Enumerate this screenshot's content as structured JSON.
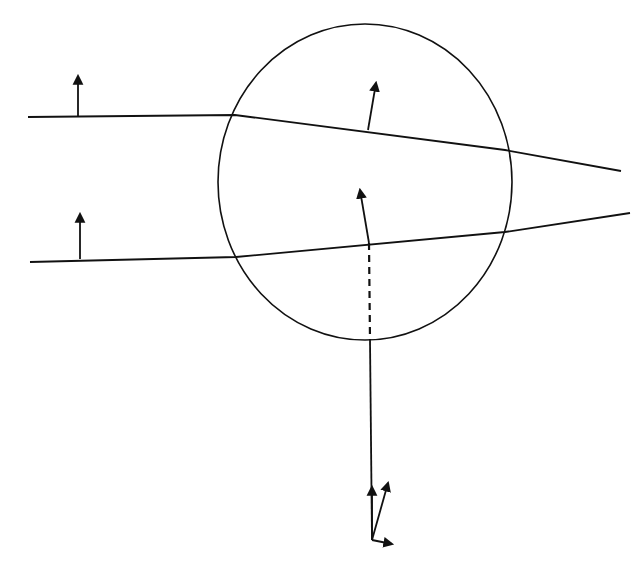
{
  "diagram": {
    "width": 641,
    "height": 567,
    "stroke_color": "#111111",
    "background": "#ffffff",
    "circle": {
      "cx": 365,
      "cy": 182,
      "rx": 147,
      "ry": 158
    },
    "beam_lines": [
      {
        "name": "upper-ray",
        "points": "28,117 235,115 505,150 621,171"
      },
      {
        "name": "lower-ray",
        "points": "30,262 236,257 505,232 630,213"
      }
    ],
    "arrows": [
      {
        "name": "upper-incident-arrow",
        "x1": 78,
        "y1": 117,
        "x2": 78,
        "y2": 76
      },
      {
        "name": "lower-incident-arrow",
        "x1": 80,
        "y1": 259,
        "x2": 80,
        "y2": 214
      },
      {
        "name": "upper-refracted-arrow",
        "x1": 368,
        "y1": 130,
        "x2": 376,
        "y2": 83
      },
      {
        "name": "center-arrow",
        "x1": 369,
        "y1": 243,
        "x2": 360,
        "y2": 190
      },
      {
        "name": "triad-vertical-arrow",
        "x1": 372,
        "y1": 540,
        "x2": 372,
        "y2": 487
      },
      {
        "name": "triad-oblique-arrow",
        "x1": 372,
        "y1": 540,
        "x2": 388,
        "y2": 483
      },
      {
        "name": "triad-horizontal-arrow",
        "x1": 372,
        "y1": 540,
        "x2": 392,
        "y2": 544
      }
    ],
    "dashed_line": {
      "x1": 369,
      "y1": 243,
      "x2": 370,
      "y2": 340
    },
    "vertical_line": {
      "x1": 370,
      "y1": 340,
      "x2": 372,
      "y2": 540
    }
  }
}
